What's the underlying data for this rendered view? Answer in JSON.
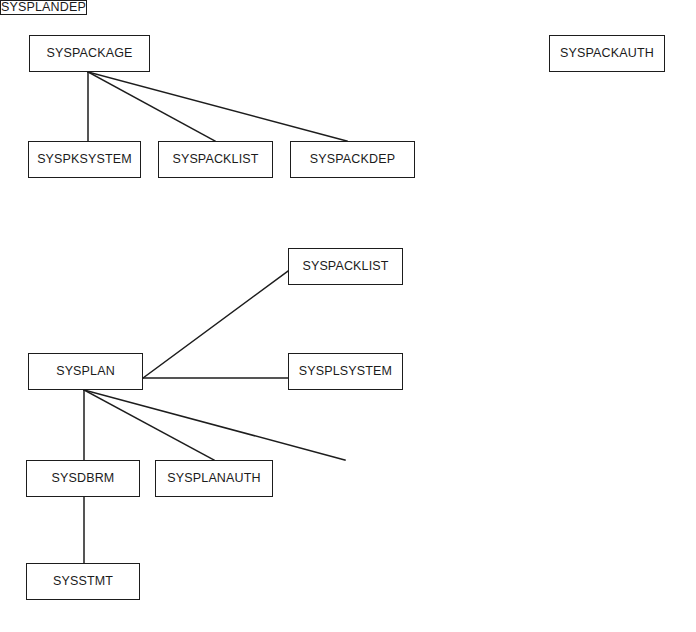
{
  "diagram": {
    "background_color": "#ffffff",
    "line_color": "#1d1d1d",
    "text_color": "#1b1b1b",
    "width": 696,
    "height": 632,
    "groups": [
      {
        "id": "package-group",
        "root": "SYSPACKAGE"
      },
      {
        "id": "packauth-group",
        "root": "SYSPACKAUTH"
      },
      {
        "id": "plan-group",
        "root": "SYSPLAN"
      }
    ],
    "nodes": [
      {
        "id": "syspackage",
        "label": "SYSPACKAGE",
        "x": 29,
        "y": 35,
        "width": 121,
        "height": 37,
        "group": "package-group"
      },
      {
        "id": "syspackauth",
        "label": "SYSPACKAUTH",
        "x": 549,
        "y": 35,
        "width": 116,
        "height": 37,
        "group": "packauth-group"
      },
      {
        "id": "syspksystem",
        "label": "SYSPKSYSTEM",
        "x": 28,
        "y": 141,
        "width": 113,
        "height": 37,
        "group": "package-group"
      },
      {
        "id": "syspacklist1",
        "label": "SYSPACKLIST",
        "x": 158,
        "y": 141,
        "width": 115,
        "height": 37,
        "group": "package-group"
      },
      {
        "id": "syspackdep",
        "label": "SYSPACKDEP",
        "x": 290,
        "y": 141,
        "width": 125,
        "height": 37,
        "group": "package-group"
      },
      {
        "id": "syspacklist2",
        "label": "SYSPACKLIST",
        "x": 288,
        "y": 248,
        "width": 115,
        "height": 37,
        "group": "plan-group"
      },
      {
        "id": "sysplan",
        "label": "SYSPLAN",
        "x": 28,
        "y": 353,
        "width": 115,
        "height": 37,
        "group": "plan-group"
      },
      {
        "id": "sysplsystem",
        "label": "SYSPLSYSTEM",
        "x": 288,
        "y": 353,
        "width": 115,
        "height": 37,
        "group": "plan-group"
      },
      {
        "id": "sysdbrm",
        "label": "SYSDBRM",
        "x": 26,
        "y": 460,
        "width": 114,
        "height": 37,
        "group": "plan-group"
      },
      {
        "id": "sysplanauth",
        "label": "SYSPLANAUTH",
        "x": 155,
        "y": 460,
        "width": 118,
        "height": 37,
        "group": "plan-group"
      },
      {
        "id": "syspландep",
        "label": "SYSPLANDEP",
        "x": 287,
        "y": 460,
        "width": 116,
        "height": 37,
        "group": "plan-group"
      },
      {
        "id": "sysstmt",
        "label": "SYSSTMT",
        "x": 26,
        "y": 563,
        "width": 114,
        "height": 37,
        "group": "plan-group"
      }
    ],
    "edges": [
      {
        "id": "e-package-pksystem",
        "from": "SYSPACKAGE",
        "to": "SYSPKSYSTEM",
        "kind": "vertical",
        "x1": 88,
        "y1": 72,
        "x2": 88,
        "y2": 141
      },
      {
        "id": "e-package-packlist",
        "from": "SYSPACKAGE",
        "to": "SYSPACKLIST",
        "kind": "diagonal",
        "x1": 88,
        "y1": 72,
        "x2": 215,
        "y2": 141
      },
      {
        "id": "e-package-packdep",
        "from": "SYSPACKAGE",
        "to": "SYSPACKDEP",
        "kind": "diagonal",
        "x1": 88,
        "y1": 72,
        "x2": 347,
        "y2": 141
      },
      {
        "id": "e-plan-packlist",
        "from": "SYSPLAN",
        "to": "SYSPACKLIST",
        "kind": "diagonal",
        "x1": 143,
        "y1": 378,
        "x2": 288,
        "y2": 271
      },
      {
        "id": "e-plan-plsystem",
        "from": "SYSPLAN",
        "to": "SYSPLSYSTEM",
        "kind": "horizontal",
        "x1": 143,
        "y1": 378,
        "x2": 288,
        "y2": 378
      },
      {
        "id": "e-plan-dbrm",
        "from": "SYSPLAN",
        "to": "SYSDBRM",
        "kind": "vertical",
        "x1": 84,
        "y1": 390,
        "x2": 84,
        "y2": 460
      },
      {
        "id": "e-plan-planauth",
        "from": "SYSPLAN",
        "to": "SYSPLANAUTH",
        "kind": "diagonal",
        "x1": 84,
        "y1": 390,
        "x2": 214,
        "y2": 460
      },
      {
        "id": "e-plan-plandep",
        "from": "SYSPLAN",
        "to": "SYSPLANDEP",
        "kind": "diagonal",
        "x1": 84,
        "y1": 390,
        "x2": 345,
        "y2": 460
      },
      {
        "id": "e-dbrm-stmt",
        "from": "SYSDBRM",
        "to": "SYSSTMT",
        "kind": "vertical",
        "x1": 84,
        "y1": 497,
        "x2": 84,
        "y2": 563
      }
    ]
  }
}
